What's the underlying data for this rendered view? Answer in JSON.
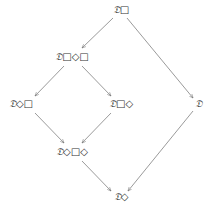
{
  "diagram": {
    "type": "lattice",
    "line_color": "#6e6e6e",
    "text_color": "#333333",
    "nodes": [
      {
        "id": "n1",
        "symbol": "𝔇",
        "modal": "□",
        "x": 121,
        "y": 10
      },
      {
        "id": "n2",
        "symbol": "𝔇",
        "modal": "□◇□",
        "x": 72,
        "y": 57
      },
      {
        "id": "n3",
        "symbol": "𝔇",
        "modal": "◇□",
        "x": 21,
        "y": 104
      },
      {
        "id": "n4",
        "symbol": "𝔇",
        "modal": "□◇",
        "x": 121,
        "y": 104
      },
      {
        "id": "n5",
        "symbol": "𝔇",
        "modal": "",
        "x": 198,
        "y": 104
      },
      {
        "id": "n6",
        "symbol": "𝔇",
        "modal": "◇□◇",
        "x": 72,
        "y": 152
      },
      {
        "id": "n7",
        "symbol": "𝔇",
        "modal": "◇",
        "x": 121,
        "y": 197
      }
    ],
    "edges": [
      {
        "from": "n1",
        "to": "n2"
      },
      {
        "from": "n1",
        "to": "n5"
      },
      {
        "from": "n2",
        "to": "n3"
      },
      {
        "from": "n2",
        "to": "n4"
      },
      {
        "from": "n3",
        "to": "n6"
      },
      {
        "from": "n4",
        "to": "n6"
      },
      {
        "from": "n6",
        "to": "n7"
      },
      {
        "from": "n5",
        "to": "n7"
      }
    ]
  }
}
